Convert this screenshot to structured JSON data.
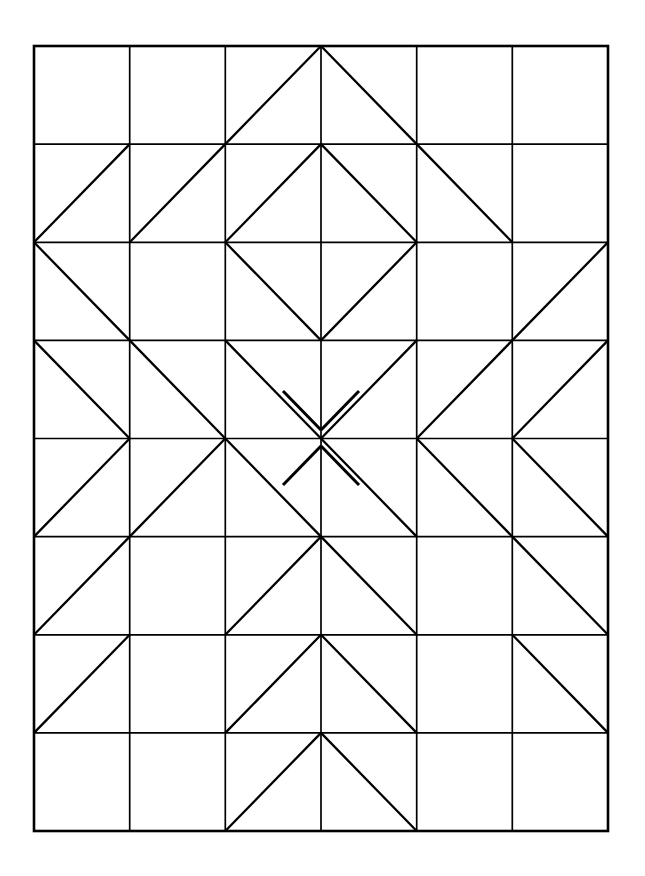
{
  "figure": {
    "background_color": "#ffffff",
    "line_color": "#000000"
  },
  "geometry": {
    "canvas_width": 645,
    "canvas_height": 876,
    "grid_left": 34,
    "grid_top": 46,
    "grid_right": 608,
    "grid_bottom": 831,
    "columns": 6,
    "rows": 8,
    "cell_width": 95.67,
    "cell_height": 98.13,
    "grid_stroke_width": 1.7,
    "border_stroke_width": 2.6,
    "diagonal_stroke_width": 2.3,
    "stub_stroke_width": 3.0
  },
  "chart_data": {
    "type": "diagram",
    "grid": {
      "rows": 8,
      "columns": 6,
      "column_x": [
        34,
        129.7,
        225.3,
        321,
        416.7,
        512.3,
        608
      ],
      "row_y": [
        46,
        144.1,
        242.3,
        340.4,
        438.5,
        536.6,
        634.8,
        732.9,
        831
      ]
    },
    "legend": {
      "main": "diagonal from top-left corner to bottom-right corner of the cell",
      "anti": "diagonal from bottom-left corner to top-right corner of the cell",
      "both": "both diagonals drawn (an X)",
      "none": "empty cell, no diagonal"
    },
    "cells": [
      {
        "row": 1,
        "values": [
          "none",
          "none",
          "anti",
          "main",
          "none",
          "none"
        ]
      },
      {
        "row": 2,
        "values": [
          "anti",
          "anti",
          "anti",
          "main",
          "main",
          "none"
        ]
      },
      {
        "row": 3,
        "values": [
          "main",
          "none",
          "main",
          "anti",
          "none",
          "anti"
        ]
      },
      {
        "row": 4,
        "values": [
          "main",
          "main",
          "main",
          "anti",
          "anti",
          "anti"
        ]
      },
      {
        "row": 5,
        "values": [
          "anti",
          "anti",
          "main",
          "main",
          "main",
          "main"
        ]
      },
      {
        "row": 6,
        "values": [
          "anti",
          "none",
          "anti",
          "main",
          "none",
          "main"
        ]
      },
      {
        "row": 7,
        "values": [
          "anti",
          "none",
          "anti",
          "main",
          "none",
          "main"
        ]
      },
      {
        "row": 8,
        "values": [
          "none",
          "none",
          "anti",
          "main",
          "none",
          "none"
        ]
      }
    ],
    "center_stubs": {
      "count": 4,
      "note": "Four short segments perpendicular to the central diamond diagonals, forming a pinwheel around the center vertex at column 3/4 and row 4/5.",
      "segments": [
        {
          "name": "stub-top-left",
          "x1": 283,
          "y1": 391,
          "x2": 321,
          "y2": 430
        },
        {
          "name": "stub-top-right",
          "x1": 359,
          "y1": 391,
          "x2": 321,
          "y2": 430
        },
        {
          "name": "stub-bottom-right",
          "x1": 359,
          "y1": 485,
          "x2": 321,
          "y2": 446
        },
        {
          "name": "stub-bottom-left",
          "x1": 283,
          "y1": 485,
          "x2": 321,
          "y2": 446
        }
      ]
    },
    "xlabel": "",
    "ylabel": "",
    "grid_on": true,
    "legend_position": "none"
  }
}
